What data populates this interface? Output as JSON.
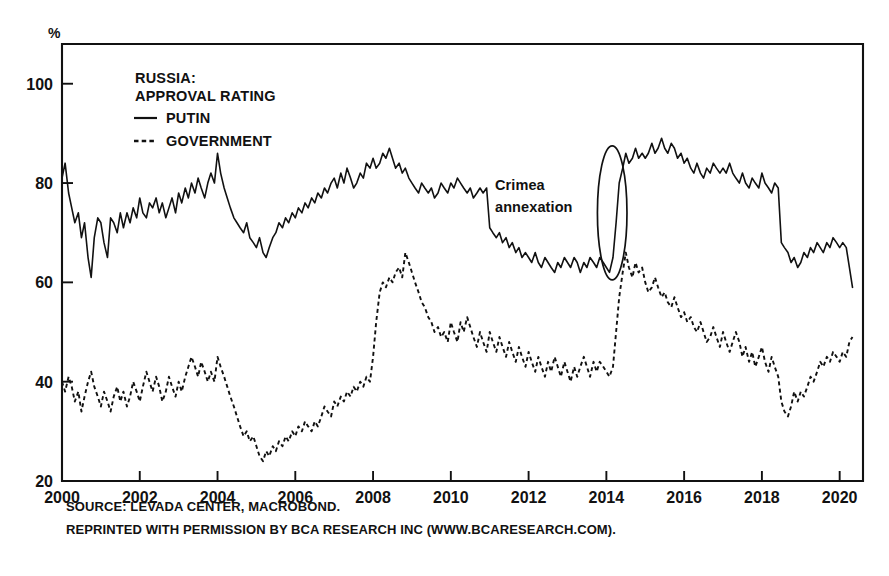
{
  "chart_data": {
    "type": "line",
    "title": "RUSSIA: APPROVAL RATING",
    "title_line1": "RUSSIA:",
    "title_line2": "APPROVAL RATING",
    "xlabel": "",
    "ylabel": "%",
    "unit_label": "%",
    "xlim": [
      2000,
      2020.6
    ],
    "ylim": [
      20,
      108
    ],
    "grid": false,
    "legend_position": "top-left-inside",
    "yticks": [
      20,
      40,
      60,
      80,
      100
    ],
    "ytick_labels": [
      "20",
      "40",
      "60",
      "80",
      "100"
    ],
    "xticks": [
      2000,
      2002,
      2004,
      2006,
      2008,
      2010,
      2012,
      2014,
      2016,
      2018,
      2020
    ],
    "xtick_labels": [
      "2000",
      "2002",
      "2004",
      "2006",
      "2008",
      "2010",
      "2012",
      "2014",
      "2016",
      "2018",
      "2020"
    ],
    "annotations": [
      {
        "text": "Crimea annexation",
        "line1": "Crimea",
        "line2": "annexation",
        "x": 2012.6,
        "y": 80,
        "marker": "ellipse",
        "marker_x": 2014.15,
        "marker_y": 74,
        "marker_rx": 0.38,
        "marker_ry": 13.5
      }
    ],
    "series": [
      {
        "name": "PUTIN",
        "label": "PUTIN",
        "style": "solid",
        "color": "#111111",
        "x": [
          2000.0,
          2000.08,
          2000.17,
          2000.25,
          2000.33,
          2000.42,
          2000.5,
          2000.58,
          2000.67,
          2000.75,
          2000.83,
          2000.92,
          2001.0,
          2001.08,
          2001.17,
          2001.25,
          2001.33,
          2001.42,
          2001.5,
          2001.58,
          2001.67,
          2001.75,
          2001.83,
          2001.92,
          2002.0,
          2002.08,
          2002.17,
          2002.25,
          2002.33,
          2002.42,
          2002.5,
          2002.58,
          2002.67,
          2002.75,
          2002.83,
          2002.92,
          2003.0,
          2003.08,
          2003.17,
          2003.25,
          2003.33,
          2003.42,
          2003.5,
          2003.58,
          2003.67,
          2003.75,
          2003.83,
          2003.92,
          2004.0,
          2004.08,
          2004.17,
          2004.25,
          2004.33,
          2004.42,
          2004.5,
          2004.58,
          2004.67,
          2004.75,
          2004.83,
          2004.92,
          2005.0,
          2005.08,
          2005.17,
          2005.25,
          2005.33,
          2005.42,
          2005.5,
          2005.58,
          2005.67,
          2005.75,
          2005.83,
          2005.92,
          2006.0,
          2006.08,
          2006.17,
          2006.25,
          2006.33,
          2006.42,
          2006.5,
          2006.58,
          2006.67,
          2006.75,
          2006.83,
          2006.92,
          2007.0,
          2007.08,
          2007.17,
          2007.25,
          2007.33,
          2007.42,
          2007.5,
          2007.58,
          2007.67,
          2007.75,
          2007.83,
          2007.92,
          2008.0,
          2008.08,
          2008.17,
          2008.25,
          2008.33,
          2008.42,
          2008.5,
          2008.58,
          2008.67,
          2008.75,
          2008.83,
          2008.92,
          2009.0,
          2009.08,
          2009.17,
          2009.25,
          2009.33,
          2009.42,
          2009.5,
          2009.58,
          2009.67,
          2009.75,
          2009.83,
          2009.92,
          2010.0,
          2010.08,
          2010.17,
          2010.25,
          2010.33,
          2010.42,
          2010.5,
          2010.58,
          2010.67,
          2010.75,
          2010.83,
          2010.92,
          2011.0,
          2011.08,
          2011.17,
          2011.25,
          2011.33,
          2011.42,
          2011.5,
          2011.58,
          2011.67,
          2011.75,
          2011.83,
          2011.92,
          2012.0,
          2012.08,
          2012.17,
          2012.25,
          2012.33,
          2012.42,
          2012.5,
          2012.58,
          2012.67,
          2012.75,
          2012.83,
          2012.92,
          2013.0,
          2013.08,
          2013.17,
          2013.25,
          2013.33,
          2013.42,
          2013.5,
          2013.58,
          2013.67,
          2013.75,
          2013.83,
          2013.92,
          2014.0,
          2014.08,
          2014.17,
          2014.25,
          2014.33,
          2014.42,
          2014.5,
          2014.58,
          2014.67,
          2014.75,
          2014.83,
          2014.92,
          2015.0,
          2015.08,
          2015.17,
          2015.25,
          2015.33,
          2015.42,
          2015.5,
          2015.58,
          2015.67,
          2015.75,
          2015.83,
          2015.92,
          2016.0,
          2016.08,
          2016.17,
          2016.25,
          2016.33,
          2016.42,
          2016.5,
          2016.58,
          2016.67,
          2016.75,
          2016.83,
          2016.92,
          2017.0,
          2017.08,
          2017.17,
          2017.25,
          2017.33,
          2017.42,
          2017.5,
          2017.58,
          2017.67,
          2017.75,
          2017.83,
          2017.92,
          2018.0,
          2018.08,
          2018.17,
          2018.25,
          2018.33,
          2018.42,
          2018.5,
          2018.58,
          2018.67,
          2018.75,
          2018.83,
          2018.92,
          2019.0,
          2019.08,
          2019.17,
          2019.25,
          2019.33,
          2019.42,
          2019.5,
          2019.58,
          2019.67,
          2019.75,
          2019.83,
          2019.92,
          2020.0,
          2020.08,
          2020.17,
          2020.25,
          2020.33
        ],
        "values": [
          81,
          84,
          78,
          75,
          72,
          74,
          69,
          72,
          65,
          61,
          69,
          73,
          72,
          68,
          65,
          73,
          72,
          70,
          74,
          71,
          74,
          72,
          75,
          73,
          77,
          74,
          73,
          76,
          75,
          77,
          74,
          76,
          73,
          75,
          77,
          74,
          78,
          76,
          79,
          77,
          80,
          78,
          81,
          79,
          77,
          80,
          82,
          80,
          86,
          82,
          79,
          77,
          75,
          73,
          72,
          71,
          70,
          72,
          69,
          68,
          67,
          69,
          66,
          65,
          67,
          69,
          70,
          72,
          71,
          73,
          72,
          74,
          73,
          75,
          74,
          76,
          75,
          77,
          76,
          78,
          77,
          79,
          78,
          80,
          81,
          79,
          82,
          80,
          83,
          81,
          79,
          80,
          82,
          81,
          84,
          83,
          85,
          83,
          84,
          86,
          85,
          87,
          85,
          83,
          84,
          82,
          83,
          81,
          80,
          79,
          78,
          80,
          79,
          78,
          79,
          77,
          78,
          80,
          79,
          78,
          80,
          79,
          81,
          80,
          79,
          78,
          79,
          77,
          78,
          79,
          78,
          79,
          71,
          70,
          69,
          70,
          68,
          69,
          67,
          68,
          66,
          67,
          65,
          66,
          65,
          64,
          66,
          64,
          63,
          65,
          64,
          63,
          62,
          64,
          63,
          65,
          64,
          63,
          65,
          64,
          62,
          64,
          63,
          65,
          64,
          63,
          65,
          64,
          63,
          62,
          65,
          72,
          80,
          83,
          86,
          84,
          85,
          87,
          85,
          86,
          85,
          86,
          88,
          86,
          87,
          89,
          87,
          86,
          88,
          87,
          85,
          86,
          84,
          85,
          83,
          82,
          84,
          82,
          81,
          83,
          82,
          84,
          83,
          82,
          83,
          82,
          84,
          82,
          81,
          80,
          82,
          80,
          79,
          81,
          80,
          79,
          82,
          80,
          79,
          78,
          80,
          79,
          68,
          67,
          66,
          64,
          65,
          63,
          64,
          66,
          65,
          67,
          66,
          68,
          67,
          66,
          68,
          67,
          69,
          68,
          67,
          68,
          67,
          63,
          59
        ]
      },
      {
        "name": "GOVERNMENT",
        "label": "GOVERNMENT",
        "style": "dashed",
        "color": "#111111",
        "x": [
          2000.0,
          2000.08,
          2000.17,
          2000.25,
          2000.33,
          2000.42,
          2000.5,
          2000.58,
          2000.67,
          2000.75,
          2000.83,
          2000.92,
          2001.0,
          2001.08,
          2001.17,
          2001.25,
          2001.33,
          2001.42,
          2001.5,
          2001.58,
          2001.67,
          2001.75,
          2001.83,
          2001.92,
          2002.0,
          2002.08,
          2002.17,
          2002.25,
          2002.33,
          2002.42,
          2002.5,
          2002.58,
          2002.67,
          2002.75,
          2002.83,
          2002.92,
          2003.0,
          2003.08,
          2003.17,
          2003.25,
          2003.33,
          2003.42,
          2003.5,
          2003.58,
          2003.67,
          2003.75,
          2003.83,
          2003.92,
          2004.0,
          2004.08,
          2004.17,
          2004.25,
          2004.33,
          2004.42,
          2004.5,
          2004.58,
          2004.67,
          2004.75,
          2004.83,
          2004.92,
          2005.0,
          2005.08,
          2005.17,
          2005.25,
          2005.33,
          2005.42,
          2005.5,
          2005.58,
          2005.67,
          2005.75,
          2005.83,
          2005.92,
          2006.0,
          2006.08,
          2006.17,
          2006.25,
          2006.33,
          2006.42,
          2006.5,
          2006.58,
          2006.67,
          2006.75,
          2006.83,
          2006.92,
          2007.0,
          2007.08,
          2007.17,
          2007.25,
          2007.33,
          2007.42,
          2007.5,
          2007.58,
          2007.67,
          2007.75,
          2007.83,
          2007.92,
          2008.0,
          2008.08,
          2008.17,
          2008.25,
          2008.33,
          2008.42,
          2008.5,
          2008.58,
          2008.67,
          2008.75,
          2008.83,
          2008.92,
          2009.0,
          2009.08,
          2009.17,
          2009.25,
          2009.33,
          2009.42,
          2009.5,
          2009.58,
          2009.67,
          2009.75,
          2009.83,
          2009.92,
          2010.0,
          2010.08,
          2010.17,
          2010.25,
          2010.33,
          2010.42,
          2010.5,
          2010.58,
          2010.67,
          2010.75,
          2010.83,
          2010.92,
          2011.0,
          2011.08,
          2011.17,
          2011.25,
          2011.33,
          2011.42,
          2011.5,
          2011.58,
          2011.67,
          2011.75,
          2011.83,
          2011.92,
          2012.0,
          2012.08,
          2012.17,
          2012.25,
          2012.33,
          2012.42,
          2012.5,
          2012.58,
          2012.67,
          2012.75,
          2012.83,
          2012.92,
          2013.0,
          2013.08,
          2013.17,
          2013.25,
          2013.33,
          2013.42,
          2013.5,
          2013.58,
          2013.67,
          2013.75,
          2013.83,
          2013.92,
          2014.0,
          2014.08,
          2014.17,
          2014.25,
          2014.33,
          2014.42,
          2014.5,
          2014.58,
          2014.67,
          2014.75,
          2014.83,
          2014.92,
          2015.0,
          2015.08,
          2015.17,
          2015.25,
          2015.33,
          2015.42,
          2015.5,
          2015.58,
          2015.67,
          2015.75,
          2015.83,
          2015.92,
          2016.0,
          2016.08,
          2016.17,
          2016.25,
          2016.33,
          2016.42,
          2016.5,
          2016.58,
          2016.67,
          2016.75,
          2016.83,
          2016.92,
          2017.0,
          2017.08,
          2017.17,
          2017.25,
          2017.33,
          2017.42,
          2017.5,
          2017.58,
          2017.67,
          2017.75,
          2017.83,
          2017.92,
          2018.0,
          2018.08,
          2018.17,
          2018.25,
          2018.33,
          2018.42,
          2018.5,
          2018.58,
          2018.67,
          2018.75,
          2018.83,
          2018.92,
          2019.0,
          2019.08,
          2019.17,
          2019.25,
          2019.33,
          2019.42,
          2019.5,
          2019.58,
          2019.67,
          2019.75,
          2019.83,
          2019.92,
          2020.0,
          2020.08,
          2020.17,
          2020.25,
          2020.33
        ],
        "values": [
          40,
          38,
          41,
          39,
          36,
          38,
          34,
          37,
          40,
          42,
          39,
          37,
          35,
          38,
          36,
          34,
          37,
          39,
          36,
          38,
          35,
          37,
          40,
          38,
          36,
          39,
          42,
          40,
          38,
          41,
          39,
          36,
          38,
          41,
          39,
          37,
          40,
          38,
          41,
          43,
          45,
          43,
          41,
          44,
          42,
          40,
          42,
          40,
          45,
          43,
          41,
          39,
          37,
          35,
          33,
          31,
          29,
          30,
          28,
          29,
          27,
          25,
          24,
          26,
          25,
          27,
          26,
          28,
          27,
          29,
          28,
          30,
          29,
          31,
          30,
          32,
          31,
          30,
          32,
          31,
          33,
          35,
          34,
          33,
          36,
          35,
          37,
          36,
          38,
          37,
          39,
          38,
          40,
          39,
          41,
          40,
          45,
          52,
          58,
          60,
          59,
          61,
          60,
          62,
          63,
          61,
          66,
          64,
          62,
          60,
          58,
          56,
          55,
          53,
          52,
          50,
          51,
          49,
          50,
          48,
          52,
          50,
          48,
          52,
          50,
          53,
          51,
          49,
          47,
          50,
          48,
          46,
          50,
          48,
          46,
          49,
          47,
          45,
          48,
          46,
          44,
          47,
          45,
          43,
          46,
          44,
          42,
          45,
          43,
          41,
          44,
          42,
          45,
          43,
          41,
          44,
          42,
          40,
          43,
          41,
          43,
          45,
          43,
          41,
          44,
          42,
          44,
          43,
          42,
          41,
          43,
          50,
          57,
          62,
          66,
          63,
          61,
          64,
          62,
          63,
          60,
          58,
          59,
          61,
          59,
          57,
          58,
          56,
          55,
          57,
          55,
          53,
          54,
          52,
          53,
          51,
          50,
          52,
          50,
          48,
          49,
          51,
          49,
          47,
          50,
          48,
          46,
          48,
          50,
          48,
          45,
          47,
          44,
          46,
          43,
          45,
          47,
          44,
          42,
          45,
          43,
          41,
          36,
          34,
          33,
          35,
          38,
          36,
          38,
          37,
          39,
          41,
          40,
          42,
          44,
          43,
          45,
          44,
          46,
          45,
          44,
          46,
          45,
          48,
          49
        ]
      }
    ]
  },
  "legend": {
    "entries": [
      {
        "label": "PUTIN",
        "style": "solid"
      },
      {
        "label": "GOVERNMENT",
        "style": "dashed"
      }
    ]
  },
  "footnotes": {
    "line1": "SOURCE: LEVADA CENTER, MACROBOND.",
    "line2": "REPRINTED WITH PERMISSION BY BCA RESEARCH INC (WWW.BCARESEARCH.COM)."
  },
  "colors": {
    "ink": "#111111",
    "background": "#ffffff"
  }
}
